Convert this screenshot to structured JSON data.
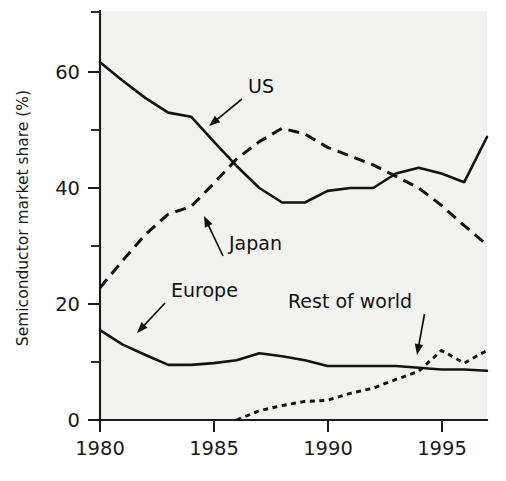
{
  "chart_data": {
    "type": "line",
    "title": "",
    "xlabel": "",
    "ylabel": "Semiconductor market share (%)",
    "xlim": [
      1980,
      1997
    ],
    "ylim": [
      0,
      68
    ],
    "grid": false,
    "legend_position": "inline-annotations",
    "x_ticks": [
      "1980",
      "1985",
      "1990",
      "1995"
    ],
    "x_tick_values": [
      1980,
      1985,
      1990,
      1995
    ],
    "y_ticks": [
      "0",
      "20",
      "40",
      "60"
    ],
    "y_tick_values": [
      0,
      20,
      40,
      60
    ],
    "y_minor_tick_values": [
      10,
      30,
      50,
      68
    ],
    "x": [
      1980,
      1981,
      1982,
      1983,
      1984,
      1985,
      1986,
      1987,
      1988,
      1989,
      1990,
      1991,
      1992,
      1993,
      1994,
      1995,
      1996,
      1997
    ],
    "series": [
      {
        "name": "US",
        "style": "solid",
        "values": [
          61.7,
          58.5,
          55.5,
          53.0,
          52.3,
          48.0,
          43.8,
          40.0,
          37.5,
          37.5,
          39.5,
          40.0,
          40.0,
          42.5,
          43.5,
          42.5,
          41.0,
          48.8
        ]
      },
      {
        "name": "Japan",
        "style": "dashed",
        "values": [
          22.8,
          27.5,
          32.0,
          35.5,
          36.8,
          40.8,
          45.0,
          48.0,
          50.3,
          49.3,
          47.0,
          45.5,
          44.0,
          42.0,
          40.0,
          37.0,
          33.5,
          30.2
        ]
      },
      {
        "name": "Europe",
        "style": "solid",
        "values": [
          15.5,
          13.0,
          11.2,
          9.5,
          9.5,
          9.8,
          10.3,
          11.5,
          11.0,
          10.3,
          9.3,
          9.3,
          9.3,
          9.3,
          9.0,
          8.7,
          8.7,
          8.5
        ]
      },
      {
        "name": "Rest of world",
        "style": "dotted",
        "start_year": 1986,
        "values": [
          null,
          null,
          null,
          null,
          null,
          null,
          0.0,
          1.6,
          2.5,
          3.2,
          3.4,
          4.6,
          5.5,
          7.0,
          8.4,
          12.0,
          9.8,
          12.0
        ]
      }
    ],
    "annotations": [
      {
        "label": "US",
        "text_x": 248,
        "text_y": 93,
        "point_x": 209,
        "point_y": 126
      },
      {
        "label": "Japan",
        "text_x": 229,
        "text_y": 250,
        "point_x": 204,
        "point_y": 216
      },
      {
        "label": "Europe",
        "text_x": 171,
        "text_y": 297,
        "point_x": 137,
        "point_y": 333
      },
      {
        "label": "Rest of world",
        "text_x": 288,
        "text_y": 308,
        "point_x": 417,
        "point_y": 355
      }
    ]
  },
  "figure": {
    "background_color": "#ffffff",
    "plot_background_color": "#f2f2f0",
    "line_color": "#121212",
    "axis_color": "#1a1a1a"
  }
}
